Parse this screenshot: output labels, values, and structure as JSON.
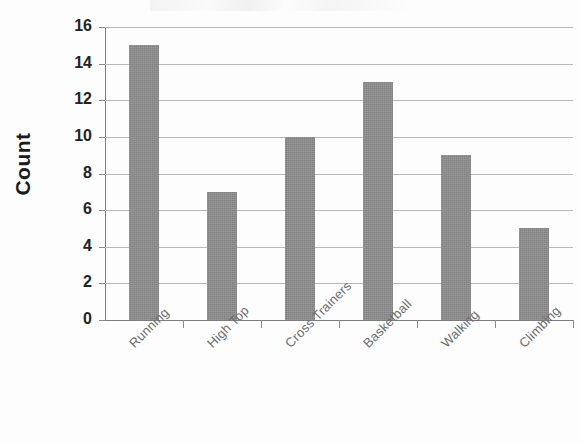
{
  "chart_data": {
    "type": "bar",
    "title": "",
    "xlabel": "",
    "ylabel": "Count",
    "categories": [
      "Running",
      "High Top",
      "Cross Trainers",
      "Basketball",
      "Walking",
      "Climbing"
    ],
    "values": [
      15,
      7,
      10,
      13,
      9,
      5
    ],
    "ylim": [
      0,
      16
    ],
    "ytick_step": 2,
    "yticks": [
      "16",
      "14",
      "12",
      "10",
      "8",
      "6",
      "4",
      "2",
      "0"
    ],
    "grid": true,
    "legend": "none",
    "bar_color": "#8c8c8c",
    "gridline_color": "#b9b9b9",
    "axis_color": "#7e7e7e",
    "label_color": "#6d6d6d",
    "tick_label_color": "#232323",
    "background_color": "#fdfdfd",
    "xlabel_rotation_deg": -45
  },
  "axes": {
    "y_title": "Count"
  }
}
